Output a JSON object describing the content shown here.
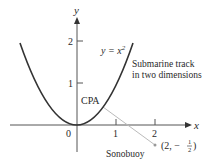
{
  "axes": {
    "x_label": "x",
    "y_label": "y",
    "x_ticks": [
      "1",
      "2"
    ],
    "y_ticks": [
      "1",
      "2"
    ],
    "origin_label": "0"
  },
  "curve": {
    "equation_lhs": "y = x",
    "equation_exp": "2",
    "description_line1": "Submarine track",
    "description_line2": "in two dimensions"
  },
  "points": {
    "cpa_label": "CPA",
    "sonobuoy_label": "Sonobuoy",
    "sonobuoy_coord_open": "(2, −",
    "sonobuoy_frac_num": "1",
    "sonobuoy_frac_den": "2",
    "sonobuoy_coord_close": ")"
  },
  "colors": {
    "curve": "#333333",
    "axis": "#555555",
    "distance_line": "#bbbbbb",
    "text": "#2a2a2a"
  }
}
